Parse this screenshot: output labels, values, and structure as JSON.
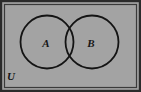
{
  "figure": {
    "type": "venn-diagram",
    "width": 141,
    "height": 92
  },
  "colors": {
    "page_background": "#ffffff",
    "universe_fill": "#a3a3a3",
    "frame_border": "#2b2b2b",
    "circle_stroke": "#141414",
    "circle_fill": "none",
    "label_color": "#161616"
  },
  "universe": {
    "label": "U",
    "label_position": "bottom-left",
    "rect": {
      "x": 4.5,
      "y": 4.5,
      "width": 132,
      "height": 83
    },
    "border_width": 1.4
  },
  "sets": [
    {
      "name": "set-a",
      "label": "A",
      "cx": 47,
      "cy": 42,
      "r": 26.5,
      "label_x": 46,
      "label_y": 47
    },
    {
      "name": "set-b",
      "label": "B",
      "cx": 92,
      "cy": 42,
      "r": 26.5,
      "label_x": 91,
      "label_y": 47
    }
  ],
  "stroke": {
    "circle_width": 1.7,
    "frame_width": 1.4,
    "outer_width": 2.2
  },
  "labels": {
    "universe": "U",
    "left_set": "A",
    "right_set": "B"
  },
  "font_sizes": {
    "set_label": "11",
    "universe_label": "11"
  }
}
